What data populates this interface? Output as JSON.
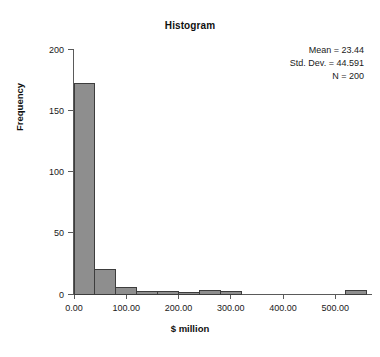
{
  "chart_data": {
    "type": "bar",
    "title": "Histogram",
    "xlabel": "$ million",
    "ylabel": "Frequency",
    "xlim": [
      -20,
      580
    ],
    "ylim": [
      0,
      200
    ],
    "grid": false,
    "legend": null,
    "bin_width": 40,
    "x_ticks": [
      {
        "value": 0,
        "label": "0.00"
      },
      {
        "value": 100,
        "label": "100.00"
      },
      {
        "value": 200,
        "label": "200.00"
      },
      {
        "value": 300,
        "label": "300.00"
      },
      {
        "value": 400,
        "label": "400.00"
      },
      {
        "value": 500,
        "label": "500.00"
      }
    ],
    "y_ticks": [
      {
        "value": 0,
        "label": "0"
      },
      {
        "value": 50,
        "label": "50"
      },
      {
        "value": 100,
        "label": "100"
      },
      {
        "value": 150,
        "label": "150"
      },
      {
        "value": 200,
        "label": "200"
      }
    ],
    "bins": [
      {
        "start": 0,
        "end": 40,
        "count": 172
      },
      {
        "start": 40,
        "end": 80,
        "count": 20
      },
      {
        "start": 80,
        "end": 120,
        "count": 5
      },
      {
        "start": 120,
        "end": 160,
        "count": 2
      },
      {
        "start": 160,
        "end": 200,
        "count": 2
      },
      {
        "start": 200,
        "end": 240,
        "count": 1
      },
      {
        "start": 240,
        "end": 280,
        "count": 3
      },
      {
        "start": 280,
        "end": 320,
        "count": 2
      },
      {
        "start": 520,
        "end": 560,
        "count": 3
      }
    ],
    "categories": [
      "0-40",
      "40-80",
      "80-120",
      "120-160",
      "160-200",
      "200-240",
      "240-280",
      "280-320",
      "520-560"
    ],
    "values": [
      172,
      20,
      5,
      2,
      2,
      1,
      3,
      2,
      3
    ],
    "annotations": {
      "mean_label": "Mean = 23.44",
      "stddev_label": "Std. Dev. = 44.591",
      "n_label": "N = 200"
    },
    "colors": {
      "bar_fill": "#8e8e8e",
      "bar_stroke": "#3d3d3d",
      "axis": "#5a5a5a",
      "text": "#1a1a1a",
      "background": "#ffffff"
    }
  }
}
